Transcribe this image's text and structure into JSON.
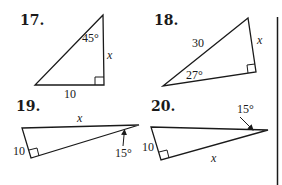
{
  "problems": [
    {
      "number": "17.",
      "labels": {
        "angle": "45°",
        "side_vertical": "x",
        "side_bottom": "10"
      },
      "right_angle": true
    },
    {
      "number": "18.",
      "labels": {
        "hypotenuse": "30",
        "side_right": "x",
        "angle": "27°"
      },
      "right_angle": true
    },
    {
      "number": "19.",
      "labels": {
        "side_top": "x",
        "side_left": "10",
        "angle": "15°"
      },
      "right_angle": true
    },
    {
      "number": "20.",
      "labels": {
        "angle": "15°",
        "side_left": "10",
        "side_bottom": "x"
      },
      "right_angle": true
    }
  ],
  "colors": {
    "ink": "#1a1a1a",
    "background": "#ffffff"
  }
}
